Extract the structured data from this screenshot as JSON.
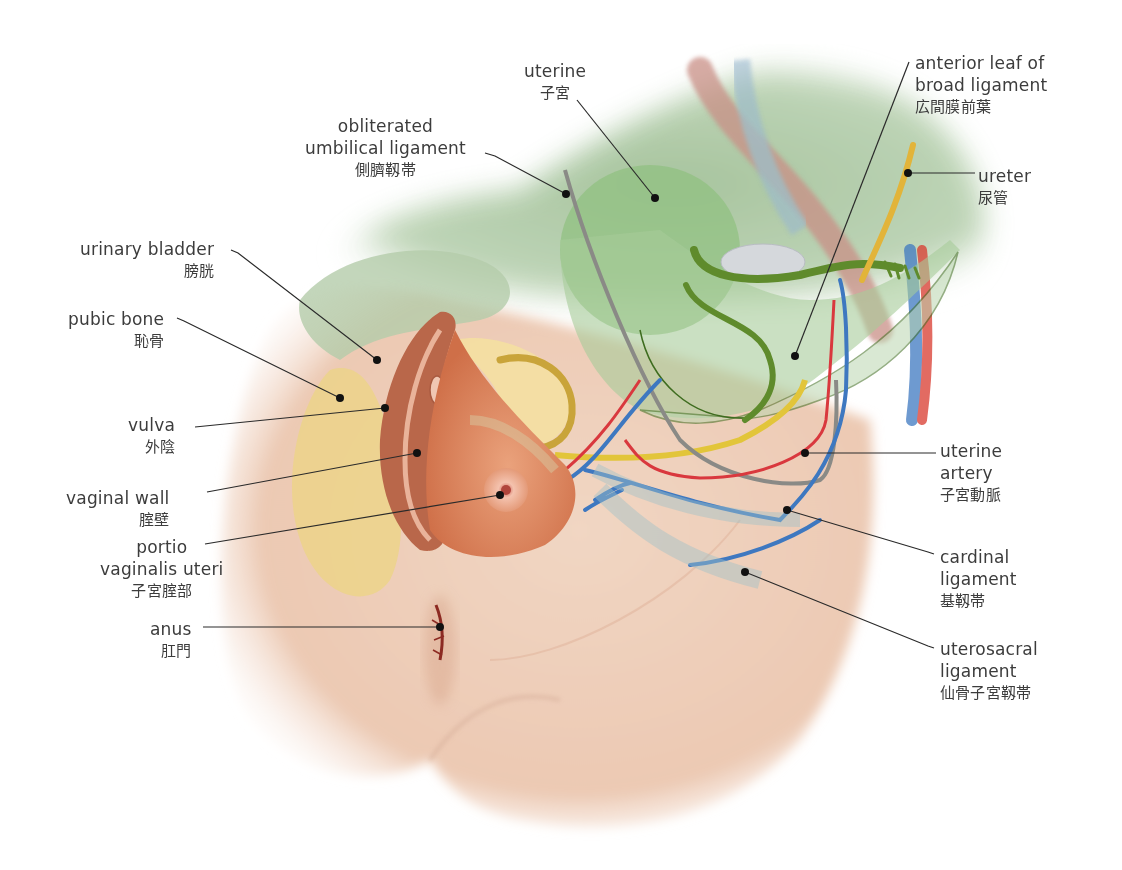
{
  "diagram": {
    "colors": {
      "skin": "#efd2bf",
      "skin_shadow": "#e2b79c",
      "peritoneum_green": "#a9c9a2",
      "uterus_green": "#8ec07f",
      "tube_green": "#5f8b2c",
      "pubic_bone": "#ecd48a",
      "vaginal_wall": "#de8a62",
      "ureter": "#e2b43a",
      "artery": "#d9383e",
      "vein": "#3e78c0",
      "obliterated_ligament": "#8a8a86",
      "ovary": "#d5d8dc",
      "leader_line": "#2a2a2a"
    },
    "labels": [
      {
        "id": "uterine",
        "en": [
          "uterine"
        ],
        "jp": "子宮",
        "x": 524,
        "y": 60,
        "align": "center"
      },
      {
        "id": "obliterated-umbilical-ligament",
        "en": [
          "obliterated",
          "umbilical ligament"
        ],
        "jp": "側臍靱帯",
        "x": 305,
        "y": 115,
        "align": "center"
      },
      {
        "id": "anterior-leaf-broad-ligament",
        "en": [
          "anterior leaf of",
          "broad ligament"
        ],
        "jp": "広間膜前葉",
        "x": 915,
        "y": 52,
        "align": "left"
      },
      {
        "id": "ureter",
        "en": [
          "ureter"
        ],
        "jp": "尿管",
        "x": 978,
        "y": 165,
        "align": "left"
      },
      {
        "id": "urinary-bladder",
        "en": [
          "urinary bladder"
        ],
        "jp": "膀胱",
        "x": 80,
        "y": 238,
        "align": "right"
      },
      {
        "id": "pubic-bone",
        "en": [
          "pubic bone"
        ],
        "jp": "恥骨",
        "x": 68,
        "y": 308,
        "align": "right"
      },
      {
        "id": "vulva",
        "en": [
          "vulva"
        ],
        "jp": "外陰",
        "x": 128,
        "y": 414,
        "align": "right"
      },
      {
        "id": "vaginal-wall",
        "en": [
          "vaginal wall"
        ],
        "jp": "腟壁",
        "x": 66,
        "y": 487,
        "align": "right"
      },
      {
        "id": "portio-vaginalis-uteri",
        "en": [
          "portio",
          "vaginalis uteri"
        ],
        "jp": "子宮腟部",
        "x": 100,
        "y": 536,
        "align": "center"
      },
      {
        "id": "anus",
        "en": [
          "anus"
        ],
        "jp": "肛門",
        "x": 150,
        "y": 618,
        "align": "right"
      },
      {
        "id": "uterine-artery",
        "en": [
          "uterine",
          "artery"
        ],
        "jp": "子宮動脈",
        "x": 940,
        "y": 440,
        "align": "left"
      },
      {
        "id": "cardinal-ligament",
        "en": [
          "cardinal",
          "ligament"
        ],
        "jp": "基靱帯",
        "x": 940,
        "y": 546,
        "align": "left"
      },
      {
        "id": "uterosacral-ligament",
        "en": [
          "uterosacral",
          "ligament"
        ],
        "jp": "仙骨子宮靱帯",
        "x": 940,
        "y": 638,
        "align": "left"
      }
    ],
    "leaders": [
      {
        "id": "uterine",
        "points": [
          [
            577,
            100
          ],
          [
            655,
            198
          ]
        ]
      },
      {
        "id": "obliterated-umbilical-ligament",
        "points": [
          [
            485,
            153
          ],
          [
            495,
            156
          ],
          [
            566,
            194
          ]
        ]
      },
      {
        "id": "anterior-leaf-broad-ligament",
        "points": [
          [
            909,
            62
          ],
          [
            795,
            356
          ]
        ]
      },
      {
        "id": "ureter",
        "points": [
          [
            975,
            173
          ],
          [
            908,
            173
          ]
        ]
      },
      {
        "id": "urinary-bladder",
        "points": [
          [
            231,
            250
          ],
          [
            238,
            253
          ],
          [
            377,
            360
          ]
        ]
      },
      {
        "id": "pubic-bone",
        "points": [
          [
            177,
            318
          ],
          [
            184,
            321
          ],
          [
            340,
            398
          ]
        ]
      },
      {
        "id": "vulva",
        "points": [
          [
            195,
            427
          ],
          [
            385,
            408
          ]
        ]
      },
      {
        "id": "vaginal-wall",
        "points": [
          [
            207,
            492
          ],
          [
            417,
            453
          ]
        ]
      },
      {
        "id": "portio-vaginalis-uteri",
        "points": [
          [
            205,
            544
          ],
          [
            500,
            495
          ]
        ]
      },
      {
        "id": "anus",
        "points": [
          [
            203,
            627
          ],
          [
            440,
            627
          ]
        ]
      },
      {
        "id": "uterine-artery",
        "points": [
          [
            936,
            453
          ],
          [
            805,
            453
          ]
        ]
      },
      {
        "id": "cardinal-ligament",
        "points": [
          [
            934,
            554
          ],
          [
            928,
            552
          ],
          [
            787,
            510
          ]
        ]
      },
      {
        "id": "uterosacral-ligament",
        "points": [
          [
            934,
            648
          ],
          [
            928,
            646
          ],
          [
            745,
            572
          ]
        ]
      }
    ]
  }
}
